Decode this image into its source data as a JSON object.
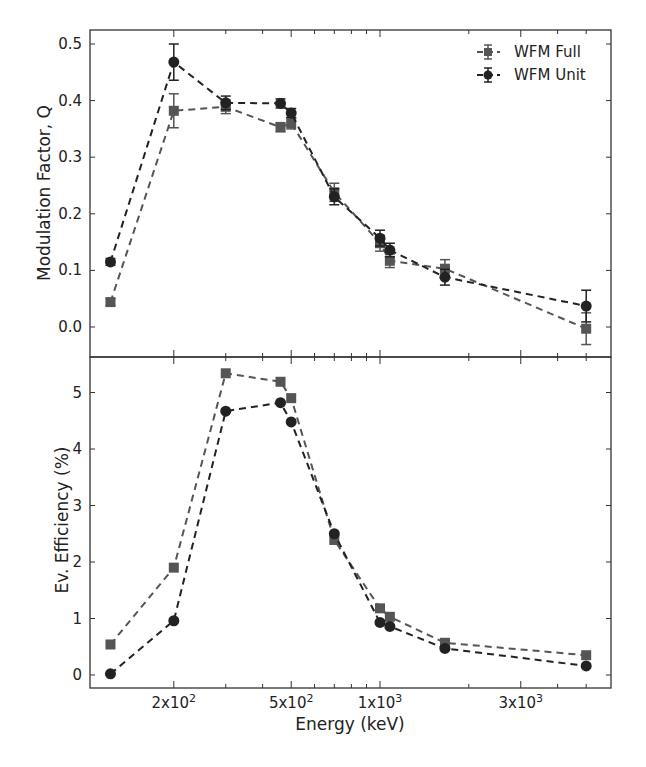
{
  "chart_data": [
    {
      "panel": "top",
      "type": "line",
      "title": "",
      "xlabel": "",
      "ylabel": "Modulation Factor, Q",
      "xscale": "log",
      "xlim": [
        112,
        6070
      ],
      "ylim": [
        -0.054,
        0.524
      ],
      "yticks": [
        0.0,
        0.1,
        0.2,
        0.3,
        0.4,
        0.5
      ],
      "ytick_labels": [
        "0.0",
        "0.1",
        "0.2",
        "0.3",
        "0.4",
        "0.5"
      ],
      "grid": false,
      "legend": {
        "position": "upper right",
        "entries": [
          "WFM Full",
          "WFM Unit"
        ]
      },
      "x": [
        122,
        200,
        300,
        460,
        500,
        700,
        1000,
        1080,
        1660,
        5000
      ],
      "series": [
        {
          "name": "WFM Full",
          "marker": "square",
          "color": "#555555",
          "linestyle": "dashed",
          "values": [
            0.044,
            0.382,
            0.389,
            0.353,
            0.36,
            0.238,
            0.148,
            0.117,
            0.103,
            -0.003
          ],
          "errors": [
            0.006,
            0.03,
            0.012,
            0.008,
            0.01,
            0.016,
            0.014,
            0.012,
            0.016,
            0.028
          ]
        },
        {
          "name": "WFM Unit",
          "marker": "circle",
          "color": "#222222",
          "linestyle": "dashed",
          "values": [
            0.115,
            0.468,
            0.396,
            0.395,
            0.378,
            0.23,
            0.157,
            0.136,
            0.088,
            0.037
          ],
          "errors": [
            0.006,
            0.032,
            0.012,
            0.008,
            0.008,
            0.014,
            0.014,
            0.012,
            0.014,
            0.028
          ]
        }
      ]
    },
    {
      "panel": "bottom",
      "type": "line",
      "title": "",
      "xlabel": "Energy (keV)",
      "ylabel": "Ev. Efficiency (%)",
      "xscale": "log",
      "xlim": [
        112,
        6070
      ],
      "ylim": [
        -0.23,
        5.6
      ],
      "yticks": [
        0,
        1,
        2,
        3,
        4,
        5
      ],
      "ytick_labels": [
        "0",
        "1",
        "2",
        "3",
        "4",
        "5"
      ],
      "xticks_major": [
        200,
        500,
        1000,
        3000
      ],
      "xtick_labels": [
        "2x10^2",
        "5x10^2",
        "1x10^3",
        "3x10^3"
      ],
      "xticks_minor": [
        300,
        400,
        600,
        700,
        800,
        900,
        2000,
        4000,
        5000
      ],
      "grid": false,
      "x": [
        122,
        200,
        300,
        460,
        500,
        700,
        1000,
        1080,
        1660,
        5000
      ],
      "series": [
        {
          "name": "WFM Full",
          "marker": "square",
          "color": "#555555",
          "linestyle": "dashed",
          "values": [
            0.54,
            1.9,
            5.34,
            5.19,
            4.9,
            2.39,
            1.18,
            1.03,
            0.57,
            0.35
          ]
        },
        {
          "name": "WFM Unit",
          "marker": "circle",
          "color": "#222222",
          "linestyle": "dashed",
          "values": [
            0.02,
            0.96,
            4.67,
            4.82,
            4.48,
            2.5,
            0.93,
            0.86,
            0.47,
            0.16
          ]
        }
      ]
    }
  ],
  "labels": {
    "top_ylabel": "Modulation Factor, Q",
    "bottom_ylabel": "Ev. Efficiency (%)",
    "xlabel": "Energy (keV)",
    "legend_full": "WFM Full",
    "legend_unit": "WFM Unit"
  },
  "xtick_text": [
    {
      "mant": "2x10",
      "exp": "2"
    },
    {
      "mant": "5x10",
      "exp": "2"
    },
    {
      "mant": "1x10",
      "exp": "3"
    },
    {
      "mant": "3x10",
      "exp": "3"
    }
  ]
}
